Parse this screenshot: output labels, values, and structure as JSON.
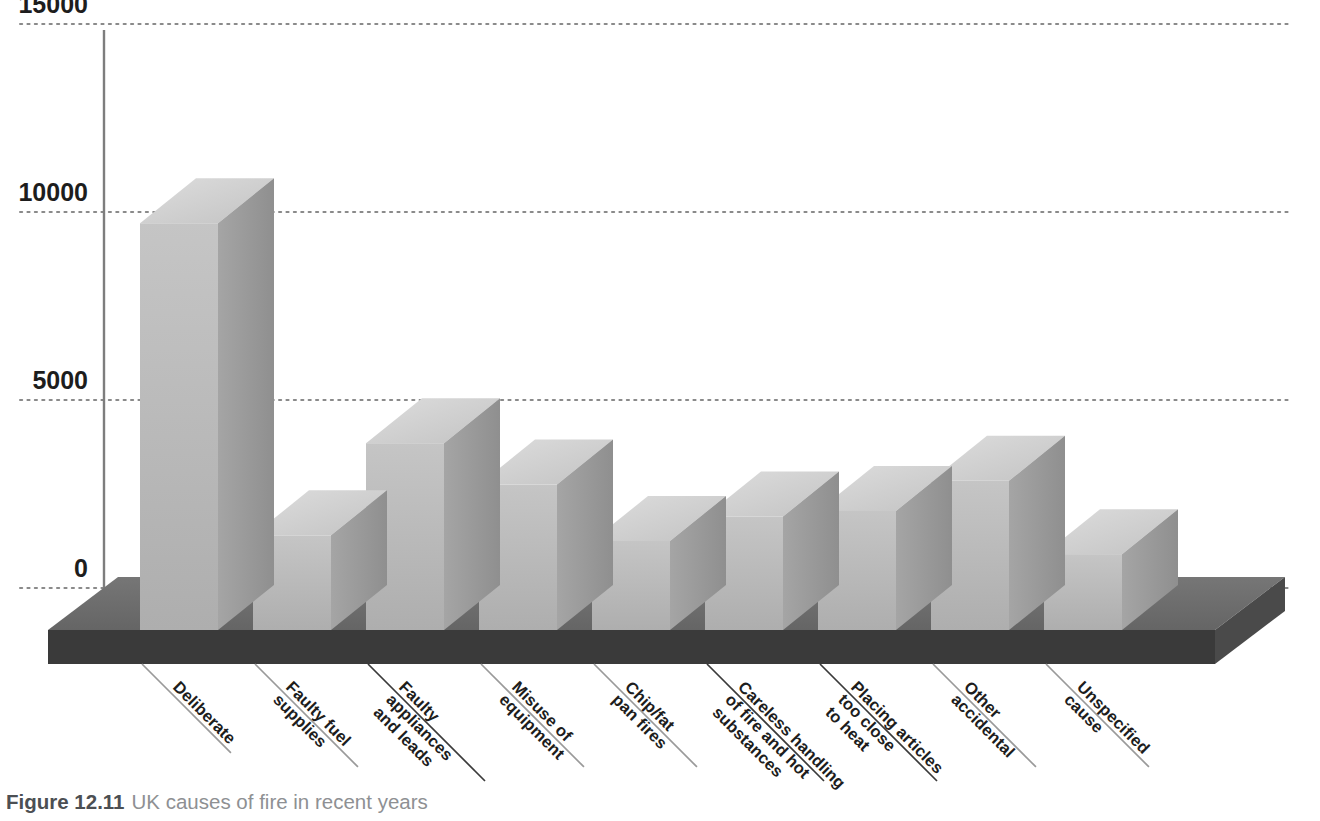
{
  "caption": {
    "figure_number": "Figure 12.11",
    "text": "UK causes of fire in recent years"
  },
  "axis": {
    "y_ticks": [
      "15000",
      "10000",
      "5000",
      "0"
    ]
  },
  "chart_data": {
    "type": "bar",
    "title": "UK causes of fire in recent years",
    "xlabel": "",
    "ylabel": "",
    "ylim": [
      0,
      15000
    ],
    "ytick_values": [
      0,
      5000,
      10000,
      15000
    ],
    "grid": true,
    "grid_style": "dotted-horizontal",
    "legend": "none",
    "style": "3d-isometric-bars",
    "categories": [
      "Deliberate",
      "Faulty fuel supplies",
      "Faulty appliances and leads",
      "Misuse of equipment",
      "Chip/fat pan fires",
      "Careless handling of fire and hot substances",
      "Placing articles too close to heat",
      "Other accidental",
      "Unspecified cause"
    ],
    "category_label_lines": [
      [
        "Deliberate"
      ],
      [
        "Faulty fuel",
        "supplies"
      ],
      [
        "Faulty",
        "appliances",
        "and leads"
      ],
      [
        "Misuse of",
        "equipment"
      ],
      [
        "Chip/fat",
        "pan fires"
      ],
      [
        "Careless handling",
        "of fire and hot",
        "substances"
      ],
      [
        "Placing articles",
        "too close",
        "to heat"
      ],
      [
        "Other",
        "accidental"
      ],
      [
        "Unspecified",
        "cause"
      ]
    ],
    "values": [
      9700,
      1400,
      3850,
      2750,
      1250,
      1900,
      2050,
      2850,
      900
    ]
  },
  "colors": {
    "bar_front": "#b9b9b9",
    "bar_top": "#d2d2d2",
    "bar_side": "#9b9b9b",
    "floor_top": "#6f6f6f",
    "floor_front": "#3a3a3a",
    "gridline": "#8a8a8a",
    "axis_line": "#7d7d7d",
    "leader_line": "#9a9a9a",
    "text": "#1d1d1d",
    "caption_text": "#8e9093"
  }
}
